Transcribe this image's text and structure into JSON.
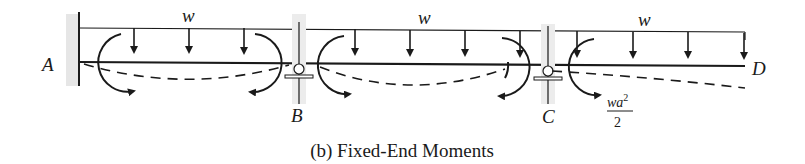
{
  "caption": "(b) Fixed-End Moments",
  "supports": {
    "A": {
      "label": "A",
      "type": "fixed"
    },
    "B": {
      "label": "B",
      "type": "roller"
    },
    "C": {
      "label": "C",
      "type": "roller"
    },
    "D": {
      "label": "D",
      "type": "free-end"
    }
  },
  "loads": {
    "span_AB": {
      "label": "w"
    },
    "span_BC": {
      "label": "w"
    },
    "span_CD": {
      "label": "w"
    }
  },
  "moment_label": {
    "numerator": "wa",
    "exponent": "2",
    "denominator": "2"
  },
  "colors": {
    "ink": "#1a1a1a",
    "wall_hatch": "#e6e6e6"
  }
}
